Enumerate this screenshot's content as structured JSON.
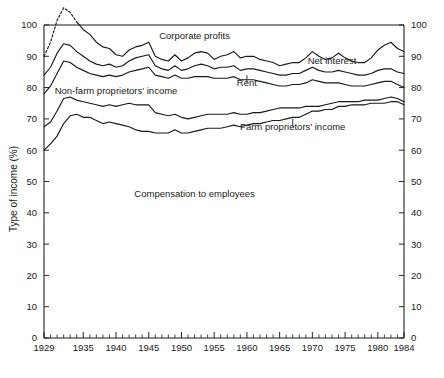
{
  "chart_data": {
    "type": "line",
    "title": "",
    "subtitle": "",
    "xlabel": "",
    "ylabel": "Type of income (%)",
    "xlim": [
      1929,
      1984
    ],
    "ylim": [
      0,
      100
    ],
    "grid": false,
    "legend_position": "inline-annotations",
    "x_ticks_major": [
      1929,
      1935,
      1940,
      1945,
      1950,
      1955,
      1960,
      1965,
      1970,
      1975,
      1980,
      1984
    ],
    "x_tick_labels": [
      "1929",
      "1935",
      "1940",
      "1945",
      "1950",
      "1955",
      "1960",
      "1965",
      "1970",
      "1975",
      "1980",
      "1984"
    ],
    "x_minor_tick_interval": 1,
    "y_ticks": [
      0,
      10,
      20,
      30,
      40,
      50,
      60,
      70,
      80,
      90,
      100
    ],
    "y_tick_labels": [
      "0",
      "10",
      "20",
      "30",
      "40",
      "50",
      "60",
      "70",
      "80",
      "90",
      "100"
    ],
    "y_axis_mirrored": true,
    "band_labels": [
      "Corporate profits",
      "Net interest",
      "Rent",
      "Non-farm proprietors' income",
      "Farm proprietors' income",
      "Compensation to employees"
    ],
    "x": [
      1929,
      1930,
      1931,
      1932,
      1933,
      1934,
      1935,
      1936,
      1937,
      1938,
      1939,
      1940,
      1941,
      1942,
      1943,
      1944,
      1945,
      1946,
      1947,
      1948,
      1949,
      1950,
      1951,
      1952,
      1953,
      1954,
      1955,
      1956,
      1957,
      1958,
      1959,
      1960,
      1961,
      1962,
      1963,
      1964,
      1965,
      1966,
      1967,
      1968,
      1969,
      1970,
      1971,
      1972,
      1973,
      1974,
      1975,
      1976,
      1977,
      1978,
      1979,
      1980,
      1981,
      1982,
      1983,
      1984
    ],
    "series": [
      {
        "name": "boundary-corporate-profits-lower",
        "note": "top boundary curve; area between this curve and 100% is Corporate profits. Dotted 1930-1933 (Depression, profits negative so curve exceeds 100%).",
        "dashed_segment_x": [
          1930,
          1931,
          1932,
          1933
        ],
        "values": [
          90.0,
          94.5,
          101.5,
          105.5,
          104.0,
          101.0,
          98.5,
          97.0,
          94.5,
          93.0,
          92.5,
          90.5,
          90.0,
          92.0,
          93.0,
          93.5,
          94.5,
          90.0,
          89.0,
          88.5,
          90.5,
          88.5,
          89.5,
          91.0,
          91.5,
          91.0,
          89.0,
          90.0,
          90.5,
          91.5,
          89.5,
          90.0,
          90.0,
          89.0,
          88.5,
          88.0,
          87.0,
          87.5,
          88.0,
          88.0,
          89.5,
          91.5,
          90.0,
          89.0,
          89.5,
          91.0,
          89.5,
          88.5,
          88.0,
          88.0,
          89.5,
          92.0,
          93.5,
          94.5,
          92.5,
          91.5
        ]
      },
      {
        "name": "boundary-net-interest-lower",
        "note": "second curve; area between it and the curve above is Net interest",
        "values": [
          84.0,
          86.5,
          91.0,
          94.0,
          93.5,
          91.5,
          90.0,
          88.5,
          87.5,
          87.0,
          87.5,
          86.5,
          87.0,
          88.5,
          89.5,
          90.0,
          90.5,
          87.0,
          86.0,
          85.5,
          87.0,
          85.5,
          86.0,
          87.0,
          87.5,
          87.0,
          86.0,
          86.5,
          86.5,
          87.0,
          85.5,
          86.0,
          86.0,
          85.5,
          85.0,
          84.5,
          84.0,
          84.0,
          84.5,
          84.5,
          85.5,
          86.5,
          85.5,
          85.0,
          85.0,
          85.5,
          85.0,
          84.5,
          84.0,
          84.0,
          84.5,
          85.5,
          86.0,
          86.0,
          85.0,
          84.5
        ]
      },
      {
        "name": "boundary-rent-lower",
        "note": "third curve; area between it and the curve above is Rent",
        "values": [
          78.0,
          80.5,
          84.5,
          88.5,
          88.0,
          86.5,
          85.5,
          84.5,
          84.0,
          83.5,
          84.0,
          83.5,
          84.0,
          85.0,
          85.5,
          86.0,
          86.5,
          84.0,
          83.5,
          83.0,
          84.0,
          83.0,
          83.0,
          83.5,
          83.5,
          83.5,
          83.0,
          83.0,
          83.0,
          83.5,
          82.5,
          82.5,
          82.5,
          82.0,
          81.5,
          81.0,
          80.5,
          80.5,
          81.0,
          81.0,
          81.5,
          82.5,
          82.0,
          81.5,
          81.5,
          81.5,
          81.0,
          80.5,
          80.5,
          80.5,
          81.0,
          81.5,
          82.0,
          82.0,
          81.0,
          80.0
        ]
      },
      {
        "name": "boundary-nonfarm-proprietors-lower",
        "note": "fourth curve; area between it and the curve above is Non-farm proprietors' income",
        "values": [
          67.5,
          69.0,
          72.5,
          76.5,
          77.0,
          76.0,
          75.5,
          75.0,
          74.5,
          74.0,
          74.5,
          74.0,
          74.5,
          75.0,
          74.5,
          74.5,
          74.5,
          72.0,
          71.5,
          71.0,
          71.5,
          70.5,
          70.0,
          70.5,
          71.0,
          71.5,
          71.5,
          71.5,
          71.5,
          72.0,
          71.5,
          71.5,
          72.0,
          72.0,
          72.5,
          73.0,
          73.5,
          73.5,
          73.5,
          73.5,
          74.0,
          74.0,
          74.0,
          74.5,
          75.0,
          75.5,
          75.5,
          75.5,
          75.5,
          76.0,
          76.0,
          76.0,
          76.5,
          77.0,
          76.5,
          75.5
        ]
      },
      {
        "name": "boundary-farm-proprietors-lower",
        "note": "fifth curve; area between it and the curve above is Farm proprietors' income; area below it is Compensation to employees",
        "values": [
          60.0,
          62.0,
          64.5,
          68.5,
          71.0,
          71.5,
          70.5,
          70.5,
          69.5,
          68.5,
          69.0,
          68.5,
          68.0,
          67.5,
          66.5,
          66.0,
          66.0,
          65.5,
          65.5,
          65.5,
          66.5,
          65.5,
          65.5,
          66.0,
          66.5,
          67.0,
          67.0,
          67.0,
          67.5,
          68.0,
          67.5,
          68.0,
          68.5,
          68.5,
          69.0,
          69.5,
          69.5,
          70.0,
          70.5,
          70.5,
          71.5,
          72.5,
          72.5,
          73.0,
          73.0,
          74.0,
          74.0,
          74.5,
          74.5,
          74.5,
          75.0,
          75.0,
          75.0,
          75.5,
          75.5,
          74.5
        ]
      }
    ],
    "annotations": [
      {
        "id": "corporate-profits",
        "text": "Corporate profits",
        "x_year": 1952,
        "y_value": 95.5,
        "leader": false
      },
      {
        "id": "net-interest",
        "text": "Net interest",
        "x_year": 1973,
        "y_value": 87.5,
        "leader": false
      },
      {
        "id": "rent",
        "text": "Rent",
        "x_year": 1960,
        "y_value": 80.5,
        "leader": true
      },
      {
        "id": "non-farm-proprietors-income",
        "text": "Non-farm proprietors' income",
        "x_year": 1940,
        "y_value": 78.0,
        "leader": false
      },
      {
        "id": "farm-proprietors-income",
        "text": "Farm proprietors' income",
        "x_year": 1967,
        "y_value": 66.5,
        "leader": true
      },
      {
        "id": "compensation-to-employees",
        "text": "Compensation to employees",
        "x_year": 1952,
        "y_value": 45.0,
        "leader": false
      }
    ],
    "colors": {
      "line": "#1a1a1a",
      "axis": "#1a1a1a",
      "background": "#ffffff"
    }
  }
}
